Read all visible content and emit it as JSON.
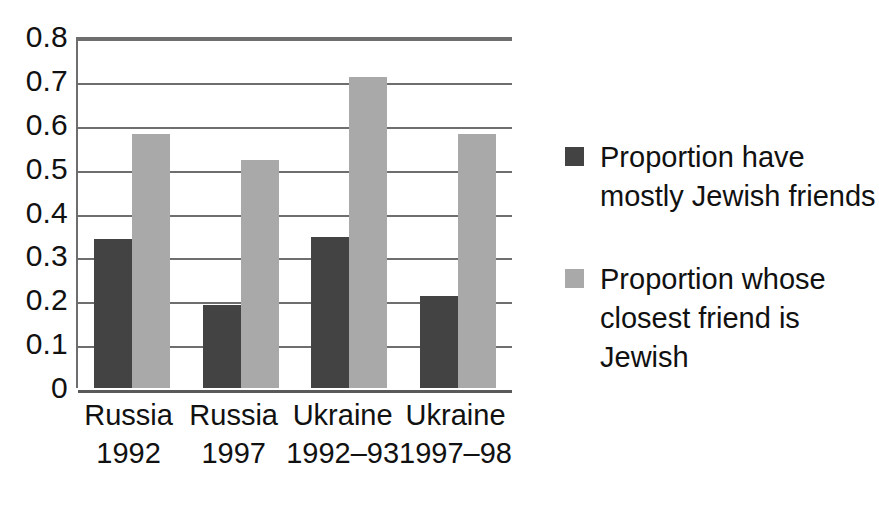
{
  "chart_data": {
    "type": "bar",
    "title": "",
    "xlabel": "",
    "ylabel": "",
    "ylim": [
      0,
      0.8
    ],
    "ytick_labels": [
      "0.8",
      "0.7",
      "0.6",
      "0.5",
      "0.4",
      "0.3",
      "0.2",
      "0.1",
      "0"
    ],
    "ytick_values": [
      0.8,
      0.7,
      0.6,
      0.5,
      0.4,
      0.3,
      0.2,
      0.1,
      0
    ],
    "grid": true,
    "legend_position": "right",
    "categories": [
      "Russia 1992",
      "Russia 1997",
      "Ukraine 1992–93",
      "Ukraine 1997–98"
    ],
    "category_lines": [
      [
        "Russia",
        "1992"
      ],
      [
        "Russia",
        "1997"
      ],
      [
        "Ukraine",
        "1992–93"
      ],
      [
        "Ukraine",
        "1997–98"
      ]
    ],
    "series": [
      {
        "name": "Proportion have mostly Jewish friends",
        "color": "#434343",
        "values": [
          0.34,
          0.19,
          0.345,
          0.21
        ]
      },
      {
        "name": "Proportion whose closest friend is Jewish",
        "color": "#a9a9a9",
        "values": [
          0.58,
          0.52,
          0.71,
          0.58
        ]
      }
    ]
  },
  "legend": {
    "items": [
      {
        "color": "#434343",
        "lines": [
          "Proportion have",
          "mostly Jewish friends"
        ]
      },
      {
        "color": "#a9a9a9",
        "lines": [
          "Proportion whose",
          "closest friend is",
          "Jewish"
        ]
      }
    ]
  },
  "colors": {
    "series_dark": "#434343",
    "series_light": "#a9a9a9",
    "axis": "#6e6e6e",
    "background": "#ffffff",
    "text": "#111111"
  }
}
